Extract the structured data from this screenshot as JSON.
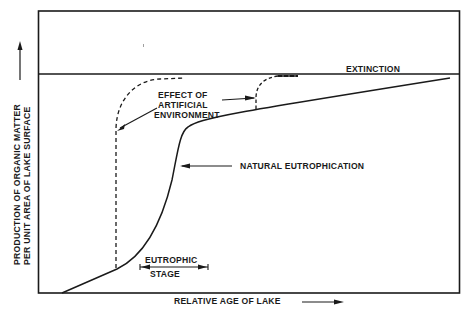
{
  "diagram": {
    "type": "line-diagram",
    "colors": {
      "ink": "#1a1a1a",
      "background": "#ffffff"
    },
    "axes": {
      "x_label": "RELATIVE AGE OF LAKE",
      "y_label_line1": "PRODUCTION OF ORGANIC MATTER",
      "y_label_line2": "PER UNIT AREA OF LAKE SURFACE"
    },
    "labels": {
      "extinction": "EXTINCTION",
      "effect_line1": "EFFECT OF",
      "effect_line2": "ARTIFICIAL",
      "effect_line3": "ENVIRONMENT",
      "natural": "NATURAL EUTROPHICATION",
      "stage_line1": "EUTROPHIC",
      "stage_line2": "STAGE"
    },
    "curves": [
      {
        "name": "natural-eutrophication",
        "style": "solid"
      },
      {
        "name": "artificial-effect-early",
        "style": "dashed"
      },
      {
        "name": "artificial-effect-late",
        "style": "dashed"
      },
      {
        "name": "extinction-line",
        "style": "solid"
      }
    ]
  }
}
